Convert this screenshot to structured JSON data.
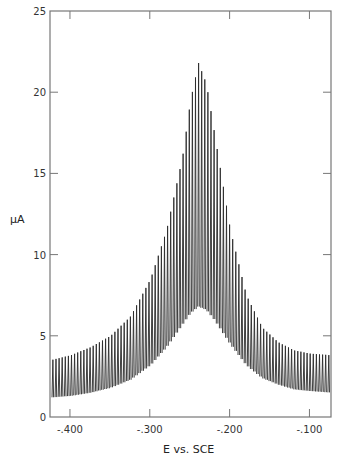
{
  "chart_data": {
    "type": "line",
    "title": "",
    "xlabel": "E vs. SCE",
    "ylabel": "μA",
    "xlim": [
      -425,
      -73
    ],
    "ylim": [
      0,
      25
    ],
    "x_ticks": [
      -400,
      -300,
      -200,
      -100
    ],
    "x_tick_labels": [
      "-.400",
      "-.300",
      "-.200",
      "-.100"
    ],
    "y_ticks": [
      0,
      5,
      10,
      15,
      20,
      25
    ],
    "y_tick_labels": [
      "0",
      "5",
      "10",
      "15",
      "20",
      "25"
    ],
    "grid": false,
    "legend": null,
    "series": [
      {
        "name": "upper envelope",
        "x": [
          -425,
          -400,
          -375,
          -350,
          -325,
          -300,
          -280,
          -260,
          -250,
          -240,
          -230,
          -220,
          -200,
          -180,
          -160,
          -140,
          -120,
          -100,
          -73
        ],
        "values": [
          3.5,
          3.8,
          4.3,
          5.0,
          6.2,
          8.5,
          11.5,
          16.0,
          19.5,
          21.8,
          20.5,
          17.5,
          11.5,
          7.5,
          5.5,
          4.6,
          4.1,
          3.9,
          3.8
        ]
      },
      {
        "name": "lower envelope",
        "x": [
          -425,
          -400,
          -375,
          -350,
          -325,
          -300,
          -280,
          -260,
          -250,
          -240,
          -230,
          -220,
          -200,
          -180,
          -160,
          -140,
          -120,
          -100,
          -73
        ],
        "values": [
          1.2,
          1.3,
          1.5,
          1.8,
          2.3,
          3.2,
          4.3,
          5.7,
          6.4,
          6.8,
          6.6,
          6.0,
          4.5,
          3.2,
          2.4,
          2.0,
          1.7,
          1.6,
          1.5
        ]
      }
    ]
  }
}
